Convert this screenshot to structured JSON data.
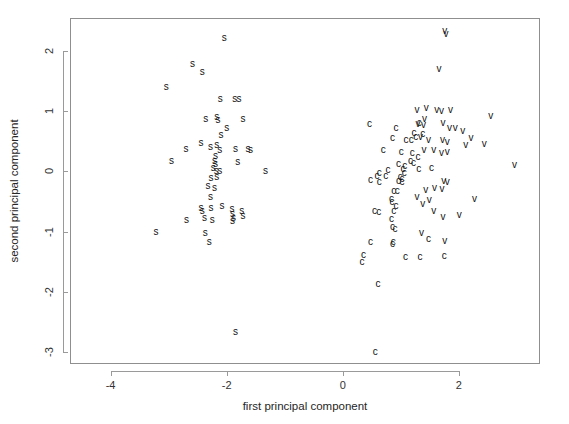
{
  "chart_data": {
    "type": "scatter",
    "title": "",
    "xlabel": "first principal component",
    "ylabel": "second principal component",
    "xlim": [
      -4.7,
      3.4
    ],
    "ylim": [
      -3.2,
      2.55
    ],
    "xticks": [
      -4,
      -2,
      0,
      2
    ],
    "xticklabels": [
      "-4",
      "-2",
      "0",
      "2"
    ],
    "yticks": [
      2,
      1,
      0,
      -1,
      -2,
      -3
    ],
    "yticklabels": [
      "2",
      "1",
      "0",
      "-1",
      "-2",
      "-3"
    ],
    "grid": false,
    "legend": false,
    "point_marker": "text-label",
    "series": [
      {
        "name": "s",
        "label": "s",
        "color": "#111111",
        "points": [
          [
            -2.04,
            2.22
          ],
          [
            -2.59,
            1.78
          ],
          [
            -2.42,
            1.65
          ],
          [
            -3.04,
            1.41
          ],
          [
            -2.11,
            1.21
          ],
          [
            -1.86,
            1.21
          ],
          [
            -1.79,
            1.21
          ],
          [
            -2.36,
            0.88
          ],
          [
            -2.17,
            0.9
          ],
          [
            -2.15,
            0.86
          ],
          [
            -1.72,
            0.88
          ],
          [
            -2.0,
            0.72
          ],
          [
            -2.1,
            0.6
          ],
          [
            -2.44,
            0.47
          ],
          [
            -2.28,
            0.4
          ],
          [
            -2.17,
            0.44
          ],
          [
            -2.12,
            0.36
          ],
          [
            -2.7,
            0.38
          ],
          [
            -1.85,
            0.38
          ],
          [
            -1.63,
            0.37
          ],
          [
            -1.59,
            0.36
          ],
          [
            -2.95,
            0.18
          ],
          [
            -2.19,
            0.25
          ],
          [
            -2.21,
            0.17
          ],
          [
            -2.19,
            0.12
          ],
          [
            -1.81,
            0.15
          ],
          [
            -2.23,
            0.05
          ],
          [
            -2.18,
            0.0
          ],
          [
            -2.12,
            0.01
          ],
          [
            -1.33,
            0.01
          ],
          [
            -2.27,
            -0.11
          ],
          [
            -2.17,
            -0.09
          ],
          [
            -2.32,
            -0.24
          ],
          [
            -2.21,
            -0.28
          ],
          [
            -2.28,
            -0.42
          ],
          [
            -2.44,
            -0.61
          ],
          [
            -2.27,
            -0.6
          ],
          [
            -2.42,
            -0.66
          ],
          [
            -2.08,
            -0.58
          ],
          [
            -1.91,
            -0.62
          ],
          [
            -1.9,
            -0.7
          ],
          [
            -1.74,
            -0.66
          ],
          [
            -1.72,
            -0.74
          ],
          [
            -2.69,
            -0.8
          ],
          [
            -2.25,
            -0.81
          ],
          [
            -2.38,
            -0.78
          ],
          [
            -1.9,
            -0.82
          ],
          [
            -1.88,
            -0.77
          ],
          [
            -3.22,
            -1.0
          ],
          [
            -2.37,
            -1.03
          ],
          [
            -2.3,
            -1.18
          ],
          [
            -1.85,
            -2.67
          ]
        ]
      },
      {
        "name": "c",
        "label": "c",
        "color": "#111111",
        "points": [
          [
            0.46,
            0.79
          ],
          [
            0.92,
            0.72
          ],
          [
            0.86,
            0.56
          ],
          [
            1.32,
            0.8
          ],
          [
            1.23,
            0.64
          ],
          [
            1.09,
            0.53
          ],
          [
            1.18,
            0.53
          ],
          [
            1.38,
            0.62
          ],
          [
            1.26,
            0.58
          ],
          [
            0.7,
            0.36
          ],
          [
            1.01,
            0.33
          ],
          [
            1.2,
            0.3
          ],
          [
            1.3,
            0.24
          ],
          [
            0.96,
            0.13
          ],
          [
            1.07,
            0.09
          ],
          [
            1.17,
            0.17
          ],
          [
            1.22,
            0.14
          ],
          [
            1.04,
            0.04
          ],
          [
            1.31,
            0.04
          ],
          [
            1.53,
            0.05
          ],
          [
            0.78,
            0.03
          ],
          [
            0.63,
            -0.03
          ],
          [
            0.59,
            -0.08
          ],
          [
            0.74,
            -0.07
          ],
          [
            0.99,
            -0.09
          ],
          [
            1.02,
            -0.12
          ],
          [
            1.06,
            -0.03
          ],
          [
            0.48,
            -0.14
          ],
          [
            0.63,
            -0.17
          ],
          [
            0.96,
            -0.16
          ],
          [
            1.02,
            -0.17
          ],
          [
            0.88,
            -0.32
          ],
          [
            0.94,
            -0.33
          ],
          [
            0.84,
            -0.46
          ],
          [
            0.85,
            -0.5
          ],
          [
            0.92,
            -0.57
          ],
          [
            0.55,
            -0.66
          ],
          [
            0.62,
            -0.67
          ],
          [
            0.88,
            -0.65
          ],
          [
            0.84,
            -0.79
          ],
          [
            0.86,
            -0.93
          ],
          [
            0.9,
            -0.96
          ],
          [
            0.48,
            -1.18
          ],
          [
            0.87,
            -1.17
          ],
          [
            0.86,
            -1.21
          ],
          [
            1.48,
            -1.13
          ],
          [
            0.36,
            -1.39
          ],
          [
            0.33,
            -1.5
          ],
          [
            1.08,
            -1.42
          ],
          [
            1.33,
            -1.42
          ],
          [
            1.75,
            -1.41
          ],
          [
            0.61,
            -1.87
          ],
          [
            0.56,
            -3.0
          ]
        ]
      },
      {
        "name": "v",
        "label": "v",
        "color": "#111111",
        "points": [
          [
            1.76,
            2.33
          ],
          [
            1.78,
            2.29
          ],
          [
            1.66,
            1.71
          ],
          [
            1.28,
            1.03
          ],
          [
            1.44,
            1.05
          ],
          [
            1.62,
            1.02
          ],
          [
            1.7,
            1.01
          ],
          [
            1.86,
            1.03
          ],
          [
            2.55,
            0.92
          ],
          [
            1.41,
            0.88
          ],
          [
            1.3,
            0.79
          ],
          [
            1.39,
            0.77
          ],
          [
            1.73,
            0.8
          ],
          [
            1.84,
            0.73
          ],
          [
            1.94,
            0.72
          ],
          [
            2.07,
            0.68
          ],
          [
            1.34,
            0.58
          ],
          [
            1.48,
            0.52
          ],
          [
            1.72,
            0.52
          ],
          [
            1.8,
            0.49
          ],
          [
            2.21,
            0.55
          ],
          [
            2.12,
            0.44
          ],
          [
            2.44,
            0.46
          ],
          [
            1.4,
            0.36
          ],
          [
            1.57,
            0.36
          ],
          [
            1.7,
            0.3
          ],
          [
            1.8,
            0.33
          ],
          [
            2.96,
            0.1
          ],
          [
            1.74,
            -0.15
          ],
          [
            1.8,
            -0.17
          ],
          [
            1.43,
            -0.3
          ],
          [
            1.58,
            -0.28
          ],
          [
            1.71,
            -0.29
          ],
          [
            1.28,
            -0.43
          ],
          [
            1.49,
            -0.48
          ],
          [
            1.38,
            -0.54
          ],
          [
            2.27,
            -0.45
          ],
          [
            1.57,
            -0.66
          ],
          [
            1.73,
            -0.76
          ],
          [
            2.01,
            -0.73
          ],
          [
            1.36,
            -1.03
          ],
          [
            1.76,
            -1.15
          ]
        ]
      }
    ]
  },
  "axis": {
    "x_title": "first principal component",
    "y_title": "second principal component",
    "x_ticklabels": [
      "-4",
      "-2",
      "0",
      "2"
    ],
    "y_ticklabels": [
      "2",
      "1",
      "0",
      "-1",
      "-2",
      "-3"
    ]
  },
  "colors": {
    "background": "#ffffff",
    "frame": "#8f8f8f",
    "point": "#111111",
    "text": "#262626"
  }
}
